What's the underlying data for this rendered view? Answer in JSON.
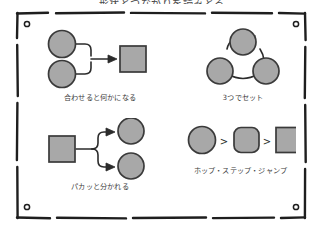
{
  "page": {
    "title": "形状とつながりを読みとる",
    "background_color": "#ffffff"
  },
  "style": {
    "shape_fill": "#a8a8a8",
    "shape_stroke": "#3a3a3a",
    "line_color": "#2b2b2b",
    "frame_color": "#1e1e1e",
    "caption_color": "#3c3c3c"
  },
  "frame": {
    "name": "hand-drawn-border",
    "corner_marks": [
      {
        "position": "top-left",
        "glyph": "o"
      },
      {
        "position": "top-right",
        "glyph": "o"
      },
      {
        "position": "bottom-left",
        "glyph": "o"
      },
      {
        "position": "bottom-right",
        "glyph": "o"
      }
    ]
  },
  "quadrants": [
    {
      "id": "merge",
      "caption": "合わせると何かになる",
      "diagram": {
        "type": "merge",
        "inputs": [
          {
            "shape": "circle",
            "fill": "#a8a8a8"
          },
          {
            "shape": "circle",
            "fill": "#a8a8a8"
          }
        ],
        "output": {
          "shape": "square",
          "fill": "#a8a8a8"
        },
        "connector": "two-to-one-arrow"
      }
    },
    {
      "id": "triad",
      "caption": "3つでセット",
      "diagram": {
        "type": "cycle",
        "nodes": [
          {
            "shape": "circle",
            "fill": "#a8a8a8",
            "position": "top"
          },
          {
            "shape": "circle",
            "fill": "#a8a8a8",
            "position": "bottom-left"
          },
          {
            "shape": "circle",
            "fill": "#a8a8a8",
            "position": "bottom-right"
          }
        ],
        "connector": "three-arcs"
      }
    },
    {
      "id": "split",
      "caption": "パカッと分かれる",
      "diagram": {
        "type": "split",
        "input": {
          "shape": "square",
          "fill": "#a8a8a8"
        },
        "outputs": [
          {
            "shape": "circle",
            "fill": "#a8a8a8"
          },
          {
            "shape": "circle",
            "fill": "#a8a8a8"
          }
        ],
        "connector": "one-to-two-arrow"
      }
    },
    {
      "id": "sequence",
      "caption": "ホップ・ステップ・ジャンプ",
      "diagram": {
        "type": "sequence",
        "steps": [
          {
            "shape": "circle",
            "fill": "#a8a8a8"
          },
          {
            "shape": "rounded-square",
            "fill": "#a8a8a8"
          },
          {
            "shape": "square",
            "fill": "#a8a8a8"
          }
        ],
        "separator": ">"
      }
    }
  ]
}
